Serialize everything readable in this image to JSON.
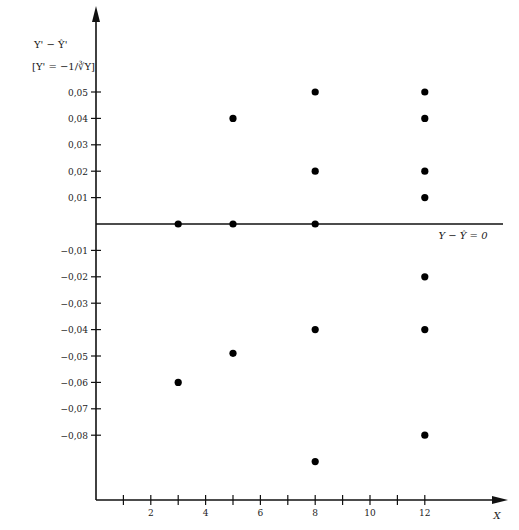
{
  "chart_data": {
    "type": "scatter",
    "title": "",
    "ylabel_line1": "Y' − Ŷ'",
    "ylabel_line2": "[Y' = −1/∛Y]",
    "xlabel": "X",
    "zero_line_label": "Y − Ŷ = 0",
    "x_ticks": [
      1,
      2,
      3,
      4,
      5,
      6,
      7,
      8,
      9,
      10,
      11,
      12
    ],
    "x_tick_labels": [
      "2",
      "4",
      "6",
      "8",
      "10",
      "12"
    ],
    "x_tick_label_values": [
      2,
      4,
      6,
      8,
      10,
      12
    ],
    "y_ticks": [
      0.05,
      0.04,
      0.03,
      0.02,
      0.01,
      -0.01,
      -0.02,
      -0.03,
      -0.04,
      -0.05,
      -0.06,
      -0.07,
      -0.08
    ],
    "y_tick_labels": [
      "0,05",
      "0,04",
      "0,03",
      "0,02",
      "0,01",
      "−0,01",
      "−0,02",
      "−0,03",
      "−0,04",
      "−0,05",
      "−0,06",
      "−0,07",
      "−0,08"
    ],
    "xlim": [
      0,
      14.8
    ],
    "ylim": [
      -0.1,
      0.08
    ],
    "grid": false,
    "points": [
      {
        "x": 3,
        "y": 0.0
      },
      {
        "x": 3,
        "y": -0.06
      },
      {
        "x": 5,
        "y": 0.04
      },
      {
        "x": 5,
        "y": 0.0
      },
      {
        "x": 5,
        "y": -0.049
      },
      {
        "x": 8,
        "y": 0.05
      },
      {
        "x": 8,
        "y": 0.02
      },
      {
        "x": 8,
        "y": 0.0
      },
      {
        "x": 8,
        "y": -0.04
      },
      {
        "x": 8,
        "y": -0.09
      },
      {
        "x": 12,
        "y": 0.05
      },
      {
        "x": 12,
        "y": 0.04
      },
      {
        "x": 12,
        "y": 0.02
      },
      {
        "x": 12,
        "y": 0.01
      },
      {
        "x": 12,
        "y": -0.02
      },
      {
        "x": 12,
        "y": -0.04
      },
      {
        "x": 12,
        "y": -0.08
      }
    ]
  }
}
